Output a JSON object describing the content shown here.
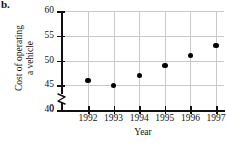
{
  "part_label": "b.",
  "axes": {
    "x_title": "Year",
    "y_title_line1": "Cost of operating",
    "y_title_line2": "a vehicle",
    "y_ticks": [
      "60",
      "55",
      "50",
      "45",
      "40",
      "0"
    ],
    "x_ticks": [
      "1992",
      "1993",
      "1994",
      "1995",
      "1996",
      "1997"
    ],
    "has_axis_break": true
  },
  "chart_data": {
    "type": "scatter",
    "title": "",
    "xlabel": "Year",
    "ylabel": "Cost of operating a vehicle",
    "categories": [
      "1992",
      "1993",
      "1994",
      "1995",
      "1996",
      "1997"
    ],
    "x": [
      1992,
      1993,
      1994,
      1995,
      1996,
      1997
    ],
    "values": [
      46,
      45,
      47,
      49,
      51,
      53
    ],
    "series": [
      {
        "name": "Cost of operating a vehicle",
        "values": [
          46,
          45,
          47,
          49,
          51,
          53
        ]
      }
    ],
    "ylim": [
      40,
      60
    ],
    "y_tick_values": [
      40,
      45,
      50,
      55,
      60
    ],
    "y_axis_break_value": 0,
    "xlim": [
      1991.5,
      1997.5
    ],
    "grid": true,
    "legend": "none",
    "marker": "filled-circle",
    "marker_color": "#000000"
  },
  "colors": {
    "background": "#ffffff",
    "axis": "#111111",
    "grid": "#c9c9c9",
    "marker": "#000000"
  }
}
